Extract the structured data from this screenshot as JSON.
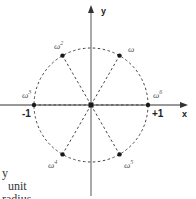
{
  "diagram": {
    "type": "argand-unit-circle",
    "center": {
      "x": 91,
      "y": 105
    },
    "radius_px": 57,
    "axes": {
      "x_label": "x",
      "y_label": "y",
      "neg_one": "-1",
      "pos_one": "+1"
    },
    "roots": [
      {
        "base": "ω",
        "exp": "",
        "angle_deg": 60
      },
      {
        "base": "ω",
        "exp": "2",
        "angle_deg": 120
      },
      {
        "base": "ω",
        "exp": "3",
        "angle_deg": 180
      },
      {
        "base": "ω",
        "exp": "4",
        "angle_deg": 240
      },
      {
        "base": "ω",
        "exp": "5",
        "angle_deg": 300
      },
      {
        "base": "ω",
        "exp": "6",
        "angle_deg": 0
      }
    ],
    "caption_lines": [
      "y",
      "unit",
      "radius"
    ],
    "colors": {
      "line": "#333333",
      "dash": "#444444",
      "point": "#1a1a1a"
    }
  }
}
